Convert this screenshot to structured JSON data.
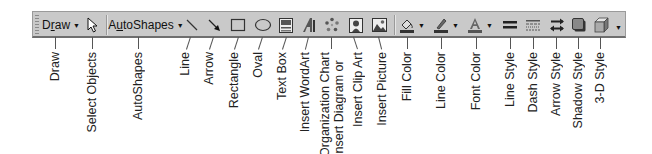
{
  "toolbar": {
    "draw_menu": {
      "label_pre": "D",
      "label_underline": "r",
      "label_post": "aw",
      "dropdown": "▼"
    },
    "autoshapes_menu": {
      "label_pre": "A",
      "label_underline": "u",
      "label_post": "toShapes",
      "dropdown": "▼"
    },
    "overflow": "▼",
    "icons": [
      "select-objects-icon",
      "line-icon",
      "arrow-icon",
      "rectangle-icon",
      "oval-icon",
      "text-box-icon",
      "insert-wordart-icon",
      "insert-diagram-icon",
      "insert-clip-art-icon",
      "insert-picture-icon",
      "fill-color-icon",
      "line-color-icon",
      "font-color-icon",
      "line-style-icon",
      "dash-style-icon",
      "arrow-style-icon",
      "shadow-style-icon",
      "3d-style-icon"
    ],
    "colors": {
      "background": "#c9c9c9",
      "border": "#6e6e6e"
    }
  },
  "callouts": [
    {
      "id": "draw",
      "label": "Draw"
    },
    {
      "id": "select-objects",
      "label": "Select Objects"
    },
    {
      "id": "autoshapes",
      "label": "AutoShapes"
    },
    {
      "id": "line",
      "label": "Line"
    },
    {
      "id": "arrow",
      "label": "Arrow"
    },
    {
      "id": "rectangle",
      "label": "Rectangle"
    },
    {
      "id": "oval",
      "label": "Oval"
    },
    {
      "id": "text-box",
      "label": "Text Box"
    },
    {
      "id": "insert-wordart",
      "label": "Insert WordArt"
    },
    {
      "id": "insert-diagram",
      "label": "Insert Diagram or",
      "label2": "Organization Chart"
    },
    {
      "id": "insert-clip-art",
      "label": "Insert Clip Art"
    },
    {
      "id": "insert-picture",
      "label": "Insert Picture"
    },
    {
      "id": "fill-color",
      "label": "Fill Color"
    },
    {
      "id": "line-color",
      "label": "Line Color"
    },
    {
      "id": "font-color",
      "label": "Font Color"
    },
    {
      "id": "line-style",
      "label": "Line Style"
    },
    {
      "id": "dash-style",
      "label": "Dash Style"
    },
    {
      "id": "arrow-style",
      "label": "Arrow Style"
    },
    {
      "id": "shadow-style",
      "label": "Shadow Style"
    },
    {
      "id": "3d-style",
      "label": "3-D Style"
    }
  ]
}
